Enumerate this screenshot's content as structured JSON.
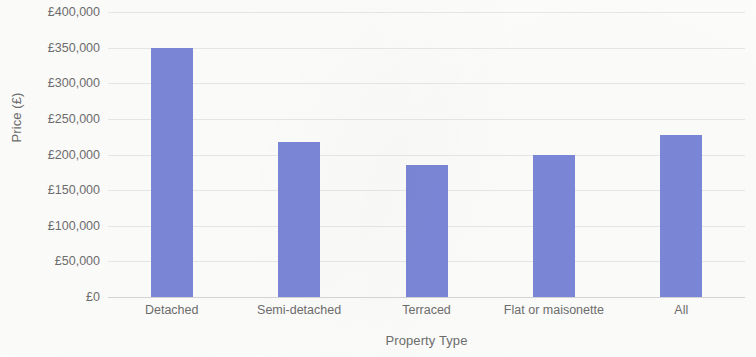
{
  "chart_data": {
    "type": "bar",
    "title": "",
    "xlabel": "Property Type",
    "ylabel": "Price (£)",
    "categories": [
      "Detached",
      "Semi-detached",
      "Terraced",
      "Flat or maisonette",
      "All"
    ],
    "values": [
      350000,
      218000,
      185000,
      200000,
      228000
    ],
    "series": [
      {
        "name": "Price",
        "values": [
          350000,
          218000,
          185000,
          200000,
          228000
        ]
      }
    ],
    "ylim": [
      0,
      400000
    ],
    "ytick_values": [
      400000,
      350000,
      300000,
      250000,
      200000,
      150000,
      100000,
      50000,
      0
    ],
    "ytick_labels": [
      "£400,000",
      "£350,000",
      "£300,000",
      "£250,000",
      "£200,000",
      "£150,000",
      "£100,000",
      "£50,000",
      "£0"
    ],
    "grid": true,
    "legend": false,
    "legend_position": "none",
    "bar_color": "#7b87d8",
    "gridline_color": "#e8e8ea",
    "axis_text_color": "#6d6d6d",
    "background_color": "#fdfdfc"
  }
}
